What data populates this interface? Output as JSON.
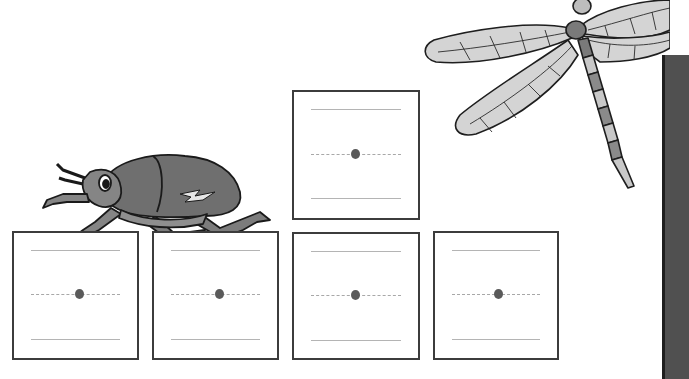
{
  "worksheet": {
    "header_text": "",
    "boxes": [
      {
        "id": "box-1",
        "position": "bottom-left",
        "has_start_dot": true
      },
      {
        "id": "box-2",
        "position": "bottom-second",
        "has_start_dot": true
      },
      {
        "id": "box-3",
        "position": "bottom-third",
        "has_start_dot": true
      },
      {
        "id": "box-4",
        "position": "bottom-right",
        "has_start_dot": true
      },
      {
        "id": "box-5",
        "position": "top-raised",
        "has_start_dot": true
      }
    ],
    "illustrations": [
      "beetle",
      "dragonfly"
    ]
  },
  "colors": {
    "box_border": "#3c3c3c",
    "guide_line": "#b4b4b4",
    "start_dot": "#5a5a5a",
    "side_bar": "#505050",
    "insect_dark": "#6e6e6e",
    "insect_light": "#d2d2d2"
  }
}
